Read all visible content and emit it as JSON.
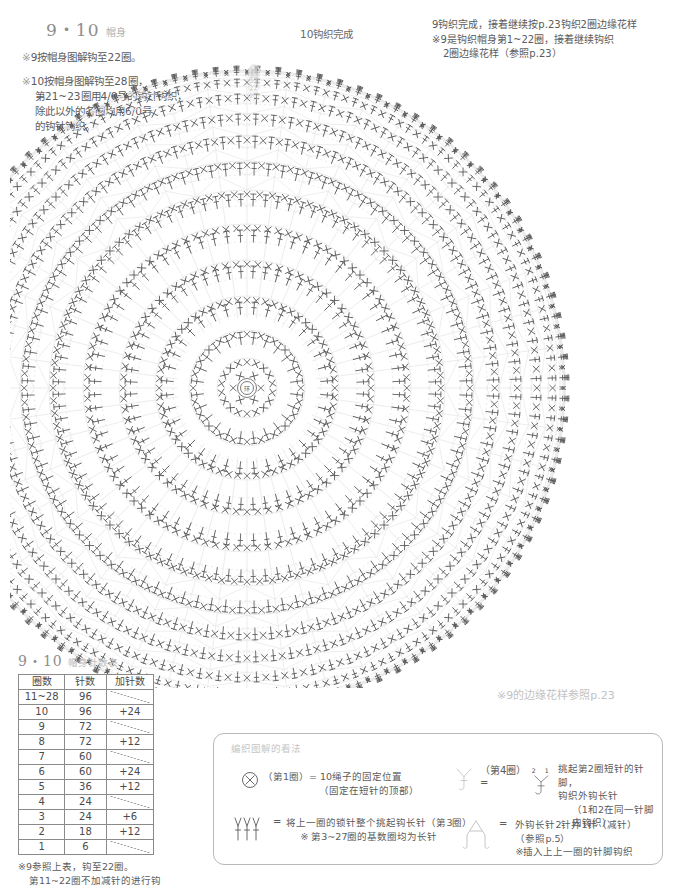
{
  "page": {
    "heading": {
      "number": "9・10",
      "label": "帽身"
    },
    "notes": [
      {
        "marker": "※",
        "lines": [
          "9按帽身图解钩至22圈。"
        ]
      },
      {
        "marker": "※",
        "lines": [
          "10按帽身图解钩至28圈，",
          "第21~23圈用4/0号的钩针钩织，",
          "除此以外的各圈均用6/0号",
          "的钩针钩织。"
        ]
      }
    ],
    "center_top_label": "10钩织完成",
    "top_right_note": [
      "9钩织完成，接着继续按p.23钩织2圈边缘花样",
      "※9是钩织帽身第1~22圈，接着继续钩织",
      "2圈边缘花样（参照p.23）"
    ],
    "right_faint_note": "※9的边缘花样参照p.23"
  },
  "table": {
    "title_number": "9・10",
    "title_label": "帽身针数表",
    "headers": [
      "圈数",
      "针数",
      "加针数"
    ],
    "rows": [
      {
        "round": "11~28",
        "stitches": "96",
        "increase": ""
      },
      {
        "round": "10",
        "stitches": "96",
        "increase": "+24"
      },
      {
        "round": "9",
        "stitches": "72",
        "increase": ""
      },
      {
        "round": "8",
        "stitches": "72",
        "increase": "+12"
      },
      {
        "round": "7",
        "stitches": "60",
        "increase": ""
      },
      {
        "round": "6",
        "stitches": "60",
        "increase": "+24"
      },
      {
        "round": "5",
        "stitches": "36",
        "increase": "+12"
      },
      {
        "round": "4",
        "stitches": "24",
        "increase": ""
      },
      {
        "round": "3",
        "stitches": "24",
        "increase": "+6"
      },
      {
        "round": "2",
        "stitches": "18",
        "increase": "+12"
      },
      {
        "round": "1",
        "stitches": "6",
        "increase": ""
      }
    ],
    "note": [
      "※9参照上表，钩至22圈。",
      "第11~22圈不加减针的进行钩织。"
    ]
  },
  "legend": {
    "title": "编织图解的看法",
    "items": [
      {
        "symbol": "sc-fixing-point-icon",
        "eq": "=",
        "text_main": "（第1圈）= 10绳子的固定位置",
        "text_sub": "（固定在短针的顶部）"
      },
      {
        "symbol": "three-dc-in-chain-icon",
        "eq": "=",
        "text_main": "将上一圈的锁针整个挑起钩长针（第3圈）",
        "text_sub": "※ 第3~27圈的基数圈均为长针"
      },
      {
        "symbol": "front-post-dc-pair-icon",
        "eq": "=",
        "label_left": "（第4圈）=",
        "num_left": "2",
        "num_right": "1",
        "text_main": "挑起第2圈短针的针脚，",
        "text_mid": "钩织外钩长针",
        "text_sub": "（1和2在同一针脚内钩织）"
      },
      {
        "symbol": "dc2tog-decrease-icon",
        "eq": "=",
        "text_main": "外钩长针2针并1针（减针）",
        "text_mid": "（参照p.5）",
        "text_sub": "※插入上上一圈的针脚钩织"
      }
    ]
  },
  "chart_data": {
    "type": "radial-crochet-diagram",
    "center_marker": "环",
    "center": {
      "x": 227,
      "y": 350
    },
    "outer_radius": 318,
    "rounds_total": 28,
    "round_numbers_shown": [
      "⑳",
      "㉑",
      "㉒",
      "㉓",
      "㉔",
      "㉕",
      "㉖",
      "㉗"
    ],
    "stitch_symbols": {
      "x": "single crochet (短针)",
      "T": "double crochet / front post (长针 / 外钩长针)",
      "oval": "chain loop (锁针)"
    },
    "series": [
      {
        "name": "round",
        "round": 1,
        "stitches": 6,
        "increase": 0,
        "radius": 18
      },
      {
        "name": "round",
        "round": 2,
        "stitches": 18,
        "increase": 12,
        "radius": 30
      },
      {
        "name": "round",
        "round": 3,
        "stitches": 24,
        "increase": 6,
        "radius": 44
      },
      {
        "name": "round",
        "round": 4,
        "stitches": 24,
        "increase": 0,
        "radius": 58
      },
      {
        "name": "round",
        "round": 5,
        "stitches": 36,
        "increase": 12,
        "radius": 74
      },
      {
        "name": "round",
        "round": 6,
        "stitches": 60,
        "increase": 24,
        "radius": 92
      },
      {
        "name": "round",
        "round": 7,
        "stitches": 60,
        "increase": 0,
        "radius": 110
      },
      {
        "name": "round",
        "round": 8,
        "stitches": 72,
        "increase": 12,
        "radius": 128
      },
      {
        "name": "round",
        "round": 9,
        "stitches": 72,
        "increase": 0,
        "radius": 146
      },
      {
        "name": "round",
        "round": 10,
        "stitches": 96,
        "increase": 24,
        "radius": 164
      },
      {
        "name": "round",
        "round": 11,
        "stitches": 96,
        "increase": 0,
        "radius": 182
      },
      {
        "name": "round",
        "round": 12,
        "stitches": 96,
        "increase": 0,
        "radius": 198
      },
      {
        "name": "round",
        "round": 13,
        "stitches": 96,
        "increase": 0,
        "radius": 213
      },
      {
        "name": "round",
        "round": 14,
        "stitches": 96,
        "increase": 0,
        "radius": 227
      },
      {
        "name": "round",
        "round": 15,
        "stitches": 96,
        "increase": 0,
        "radius": 240
      },
      {
        "name": "round",
        "round": 16,
        "stitches": 96,
        "increase": 0,
        "radius": 252
      },
      {
        "name": "round",
        "round": 17,
        "stitches": 96,
        "increase": 0,
        "radius": 263
      },
      {
        "name": "round",
        "round": 18,
        "stitches": 96,
        "increase": 0,
        "radius": 274
      },
      {
        "name": "round",
        "round": 19,
        "stitches": 96,
        "increase": 0,
        "radius": 284
      },
      {
        "name": "round",
        "round": 20,
        "stitches": 96,
        "increase": 0,
        "radius": 293
      },
      {
        "name": "round",
        "round": 21,
        "stitches": 96,
        "increase": 0,
        "radius": 301
      },
      {
        "name": "round",
        "round": 22,
        "stitches": 96,
        "increase": 0,
        "radius": 308
      },
      {
        "name": "round",
        "round": 23,
        "stitches": 96,
        "increase": 0,
        "radius": 313
      },
      {
        "name": "round",
        "round": 24,
        "stitches": 96,
        "increase": 0,
        "radius": 316
      },
      {
        "name": "round",
        "round": 25,
        "stitches": 96,
        "increase": 0,
        "radius": 317
      },
      {
        "name": "round",
        "round": 26,
        "stitches": 96,
        "increase": 0,
        "radius": 318
      },
      {
        "name": "round",
        "round": 27,
        "stitches": 96,
        "increase": 0,
        "radius": 318
      },
      {
        "name": "round",
        "round": 28,
        "stitches": 96,
        "increase": 0,
        "radius": 318
      }
    ],
    "xlabel": "",
    "ylabel": "",
    "grid": false,
    "legend_position": "bottom-right"
  }
}
